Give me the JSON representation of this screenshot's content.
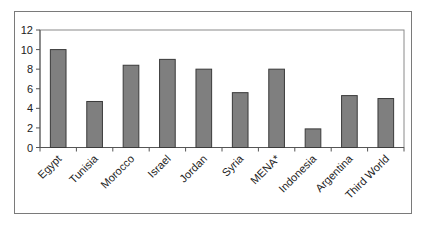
{
  "chart_data": {
    "type": "bar",
    "title": "",
    "xlabel": "",
    "ylabel": "",
    "categories": [
      "Egypt",
      "Tunisia",
      "Morocco",
      "Israel",
      "Jordan",
      "Syria",
      "MENA*",
      "Indonesia",
      "Argentina",
      "Third World"
    ],
    "values": [
      10.0,
      4.7,
      8.4,
      9.0,
      8.0,
      5.6,
      8.0,
      1.9,
      5.3,
      5.0
    ],
    "ylim": [
      0,
      12
    ],
    "yticks": [
      0,
      2,
      4,
      6,
      8,
      10,
      12
    ],
    "grid": false,
    "legend": null,
    "colors": {
      "bar_fill": "#7f7f7f",
      "bar_stroke": "#3a3a3a",
      "axis": "#555555",
      "frame": "#7a7a7a"
    }
  }
}
